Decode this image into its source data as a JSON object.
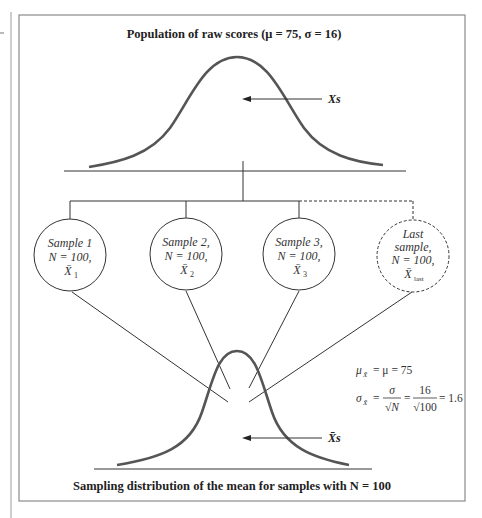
{
  "diagram": {
    "top": {
      "title": "Population of raw scores (μ = 75, σ = 16)",
      "arrow_label": "Xs"
    },
    "samples": [
      {
        "lines": [
          "Sample 1",
          "N = 100,",
          "X̄",
          "1"
        ],
        "style": "solid"
      },
      {
        "lines": [
          "Sample 2,",
          "N = 100,",
          "X̄",
          "2"
        ],
        "style": "solid"
      },
      {
        "lines": [
          "Sample 3,",
          "N = 100,",
          "X̄",
          "3"
        ],
        "style": "solid"
      },
      {
        "lines": [
          "Last",
          "sample,",
          "N = 100,",
          "X̄",
          "last"
        ],
        "style": "dashed"
      }
    ],
    "bottom": {
      "title": "Sampling distribution of the mean for samples with N = 100",
      "arrow_label": "X̄s"
    },
    "formulas": {
      "mean": {
        "lhs": "μ",
        "lhs_sub": "X̄",
        "rhs": "= μ = 75"
      },
      "sd": {
        "lhs": "σ",
        "lhs_sub": "X̄",
        "eq1": "=",
        "frac1_num": "σ",
        "frac1_den": "√N",
        "eq2": "=",
        "frac2_num": "16",
        "frac2_den": "√100",
        "result": "= 1.6"
      }
    },
    "colors": {
      "curve": "#555555",
      "lines": "#333333",
      "frame": "#8a8a8a"
    }
  }
}
